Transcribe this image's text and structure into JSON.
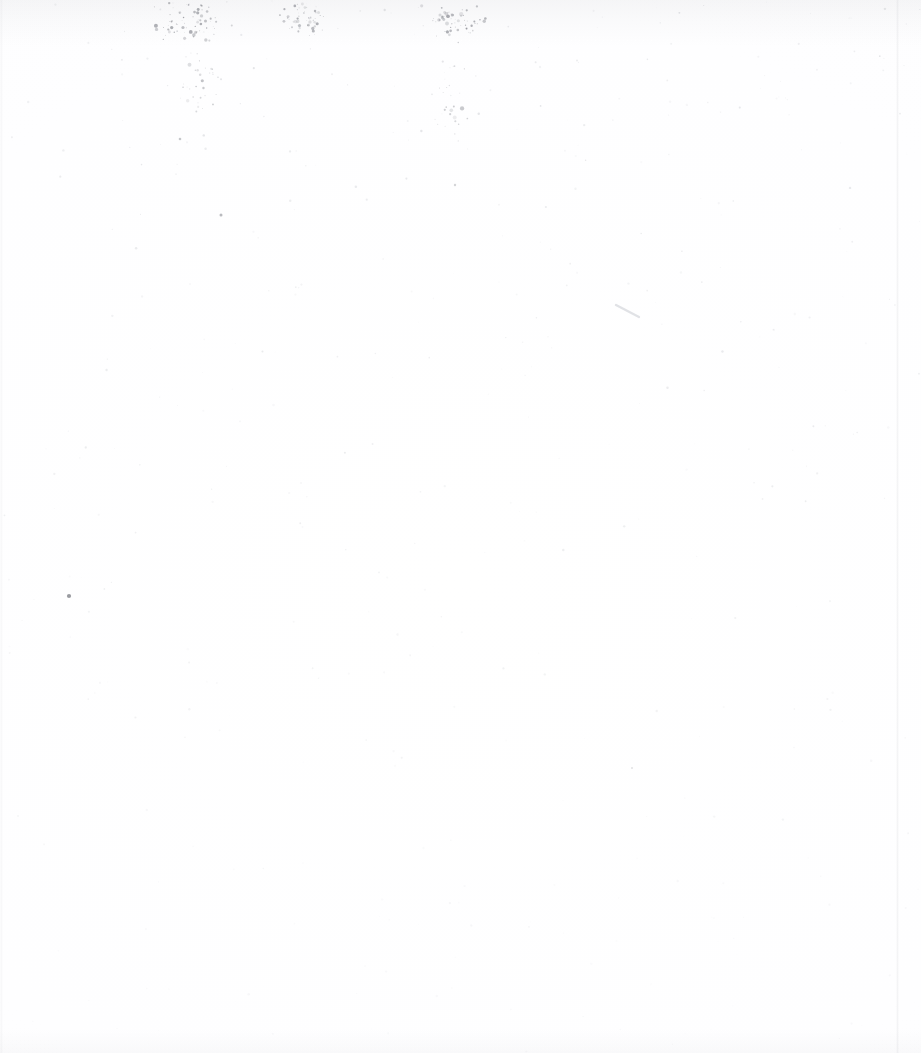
{
  "page": {
    "kind": "scanned-document-page",
    "content_description": "Blank page",
    "visible_text": "",
    "width": 921,
    "height": 1053,
    "background_color": "#fefeff",
    "paper_color": "#ffffff"
  },
  "artifacts": {
    "speck_color": "#5a5d66",
    "smudge_color": "#969aa2",
    "pencil_stroke_color": "#b9bcc4",
    "clusters": [
      {
        "name": "top-left-spray",
        "cx": 190,
        "cy": 22,
        "rx": 45,
        "ry": 30,
        "count": 70,
        "opacity": 0.55
      },
      {
        "name": "top-center-spray",
        "cx": 305,
        "cy": 18,
        "rx": 38,
        "ry": 26,
        "count": 50,
        "opacity": 0.48
      },
      {
        "name": "top-right-spray",
        "cx": 455,
        "cy": 20,
        "rx": 42,
        "ry": 30,
        "count": 62,
        "opacity": 0.52
      },
      {
        "name": "upper-drip-left",
        "cx": 195,
        "cy": 85,
        "rx": 30,
        "ry": 55,
        "count": 34,
        "opacity": 0.38
      },
      {
        "name": "upper-drip-right",
        "cx": 452,
        "cy": 95,
        "rx": 26,
        "ry": 60,
        "count": 30,
        "opacity": 0.34
      }
    ],
    "isolated_specks": [
      {
        "name": "left-mid-speck",
        "x": 69,
        "y": 596,
        "r": 2.1,
        "opacity": 0.62
      },
      {
        "name": "upper-left-fleck",
        "x": 221,
        "y": 215,
        "r": 1.5,
        "opacity": 0.42
      },
      {
        "name": "upper-left-fleck-2",
        "x": 180,
        "y": 139,
        "r": 1.3,
        "opacity": 0.34
      },
      {
        "name": "mid-fleck",
        "x": 455,
        "y": 185,
        "r": 1.2,
        "opacity": 0.26
      },
      {
        "name": "low-fleck",
        "x": 632,
        "y": 768,
        "r": 1.0,
        "opacity": 0.18
      }
    ],
    "pencil_stroke": {
      "name": "diagonal-pencil-mark",
      "x1": 616,
      "y1": 305,
      "x2": 639,
      "y2": 317,
      "width": 2.4,
      "opacity": 0.42
    }
  }
}
